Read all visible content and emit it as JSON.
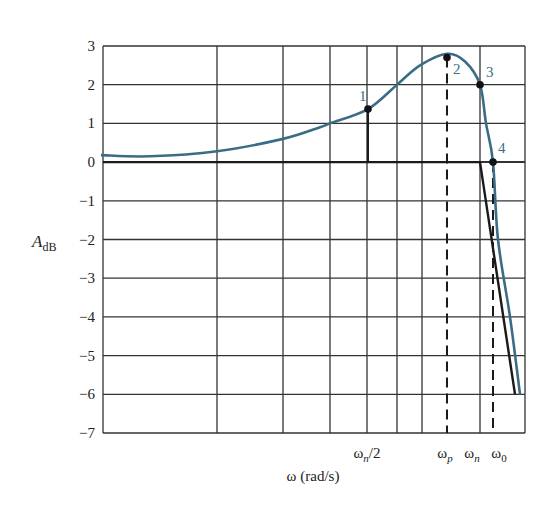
{
  "chart_data": {
    "type": "line",
    "title": "",
    "xlabel": "ω (rad/s)",
    "ylabel": "A_dB",
    "ylabel_main": "A",
    "ylabel_sub": "dB",
    "ylim": [
      -7,
      3
    ],
    "yticks": [
      3,
      2,
      1,
      0,
      -1,
      -2,
      -3,
      -4,
      -5,
      -6,
      -7
    ],
    "x_scale": "log (frequency, unlabeled decades)",
    "grid": true,
    "xtick_labels": [
      {
        "label": "ωn/2",
        "base": "ω",
        "sub": "n",
        "suffix": "/2",
        "px": 367
      },
      {
        "label": "ωp",
        "base": "ω",
        "sub": "p",
        "suffix": "",
        "px": 447
      },
      {
        "label": "ωn",
        "base": "ω",
        "sub": "n",
        "suffix": "",
        "px": 480
      },
      {
        "label": "ω0",
        "base": "ω",
        "sub": "0",
        "suffix": "",
        "px": 493
      }
    ],
    "series": [
      {
        "name": "Actual magnitude response",
        "color": "#3a6d85",
        "points_px_x": [
          101,
          150,
          217,
          283,
          320,
          330,
          368,
          397,
          420,
          447,
          465,
          480,
          486,
          493,
          498,
          510,
          520
        ],
        "values": [
          0.18,
          0.15,
          0.28,
          0.6,
          0.9,
          1.0,
          1.37,
          2.0,
          2.5,
          2.8,
          2.6,
          2.0,
          1.0,
          0.0,
          -2.0,
          -4.0,
          -6.0
        ]
      },
      {
        "name": "Asymptotic approximation",
        "color": "#1a1a1a",
        "points_px_x": [
          103,
          480,
          515
        ],
        "values": [
          0,
          0,
          -6
        ]
      }
    ],
    "marked_points": [
      {
        "id": "1",
        "px_x": 368,
        "value": 1.37,
        "at": "ωn/2"
      },
      {
        "id": "2",
        "px_x": 447,
        "value": 2.7,
        "at": "ωp"
      },
      {
        "id": "3",
        "px_x": 480,
        "value": 2.0,
        "at": "ωn"
      },
      {
        "id": "4",
        "px_x": 493,
        "value": 0.0,
        "at": "ω0"
      }
    ],
    "reference_lines": [
      {
        "type": "solid",
        "at": "ωn/2",
        "from": 0,
        "to": 1.37
      },
      {
        "type": "dashed",
        "at": "ωp",
        "from": -7,
        "to": 2.7
      },
      {
        "type": "dashed",
        "at": "ω0",
        "from": -7,
        "to": 0
      }
    ],
    "grid_x_px": [
      103,
      217,
      283,
      330,
      367,
      397,
      422,
      480,
      525
    ]
  }
}
